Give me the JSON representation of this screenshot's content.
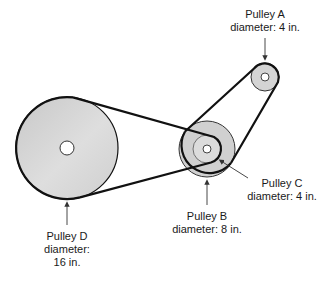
{
  "diagram": {
    "type": "pulley-system",
    "pulleys": [
      {
        "id": "A",
        "name": "Pulley A",
        "diameter_label": "diameter: 4 in.",
        "cx": 265,
        "cy": 77,
        "r": 14,
        "hub_r": 4
      },
      {
        "id": "B",
        "name": "Pulley B",
        "diameter_label": "diameter: 8 in.",
        "cx": 207,
        "cy": 149,
        "r": 28,
        "hub_r": 4
      },
      {
        "id": "C",
        "name": "Pulley C",
        "diameter_label": "diameter: 4 in.",
        "cx": 207,
        "cy": 149,
        "r": 14,
        "hub_r": 4
      },
      {
        "id": "D",
        "name": "Pulley D",
        "diameter_label_line1": "diameter:",
        "diameter_label_line2": "16 in.",
        "cx": 67,
        "cy": 148,
        "r": 51,
        "hub_r": 7
      }
    ],
    "belts": [
      {
        "from": "D",
        "to": "C"
      },
      {
        "from": "B",
        "to": "A"
      }
    ],
    "labels": {
      "a_name": "Pulley A",
      "a_diameter": "diameter: 4 in.",
      "b_name": "Pulley B",
      "b_diameter": "diameter: 8 in.",
      "c_name": "Pulley C",
      "c_diameter": "diameter: 4 in.",
      "d_name": "Pulley D",
      "d_diameter_line1": "diameter:",
      "d_diameter_line2": "16 in."
    },
    "colors": {
      "pulley_fill": "#d2d2d2",
      "inner_fill": "#dcdcdc",
      "belt": "#111111",
      "arrow": "#333333"
    }
  }
}
